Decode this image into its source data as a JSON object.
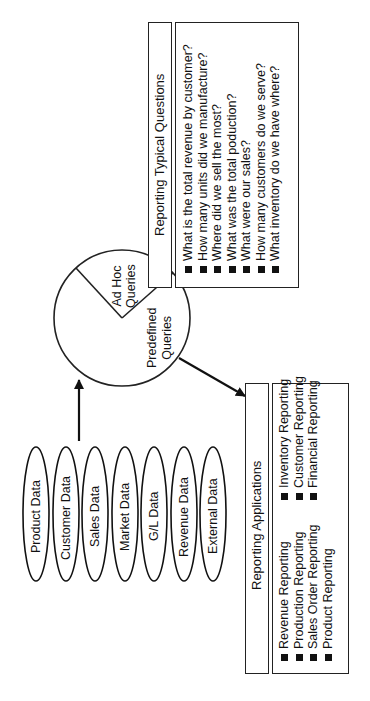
{
  "diagram": {
    "orientation": "rotated-90-ccw",
    "data_sources": [
      {
        "label": "Product Data"
      },
      {
        "label": "Customer Data"
      },
      {
        "label": "Sales Data"
      },
      {
        "label": "Market Data"
      },
      {
        "label": "G/L Data"
      },
      {
        "label": "Revenue Data"
      },
      {
        "label": "External Data"
      }
    ],
    "query_wheel": {
      "segments": [
        {
          "label_line1": "Ad Hoc",
          "label_line2": "Queries"
        },
        {
          "label_line1": "Predefined",
          "label_line2": "Queries"
        }
      ]
    },
    "typical_questions": {
      "title": "Reporting Typical Questions",
      "items": [
        "What is the total revenue by customer?",
        "How many units did we manufacture?",
        "Where did we sell the most?",
        "What was the total poduction?",
        "What were our sales?",
        "How many customers do we serve?",
        "What inventory do we have where?"
      ]
    },
    "reporting_applications": {
      "title": "Reporting Applications",
      "column_1": [
        "Revenue Reporting",
        "Production Reporting",
        "Sales Order Reporting",
        "Product Reporting"
      ],
      "column_2": [
        "Inventory Reporting",
        "Customer Reporting",
        "Financial Reporting"
      ]
    },
    "colors": {
      "line": "#222222",
      "background": "#ffffff",
      "text": "#111111"
    }
  }
}
